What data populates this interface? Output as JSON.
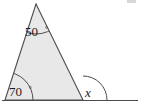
{
  "figure": {
    "type": "geometry-diagram",
    "background_color": "#ffffff",
    "stroke_color": "#4d4d4d",
    "fill_color": "#e8e8e8",
    "label_color": "#1a1a1a",
    "canvas": {
      "width": 141,
      "height": 110
    },
    "vertices": {
      "apex": {
        "x": 36,
        "y": 4
      },
      "bottom_left": {
        "x": 5,
        "y": 100
      },
      "bottom_right": {
        "x": 83,
        "y": 100
      }
    },
    "baseline": {
      "x_start": 2,
      "x_end": 138,
      "y": 100
    },
    "angles": [
      {
        "id": "apex-angle",
        "label": "50",
        "degree_symbol": "°",
        "full_label": "50°",
        "value": 50,
        "position": "apex",
        "label_x": 25,
        "label_y": 36,
        "arc_radius": 30,
        "kind": "interior"
      },
      {
        "id": "bottom-left-angle",
        "label": "70",
        "degree_symbol": "°",
        "full_label": "70°",
        "value": 70,
        "position": "bottom-left",
        "label_x": 9,
        "label_y": 96,
        "arc_radius": 28,
        "kind": "interior"
      },
      {
        "id": "exterior-angle-x",
        "label": "x",
        "degree_symbol": "",
        "full_label": "x",
        "value": null,
        "position": "bottom-right",
        "label_x": 85,
        "label_y": 97,
        "arc_radius": 24,
        "kind": "exterior"
      }
    ],
    "artifact": {
      "id": "scan-smudge",
      "x": 127,
      "y": 0,
      "width": 9,
      "height": 3,
      "color": "#c9c9c9"
    }
  },
  "chart_data": {
    "type": "diagram",
    "title": "",
    "shape": "triangle",
    "labels": [
      "50°",
      "70°",
      "x"
    ],
    "known_angles": [
      50,
      70
    ],
    "unknown_angles": [
      "x"
    ],
    "annotations": [
      "Interior angle at apex = 50°",
      "Interior angle at bottom-left vertex = 70°",
      "Exterior angle at bottom-right vertex = x"
    ]
  }
}
